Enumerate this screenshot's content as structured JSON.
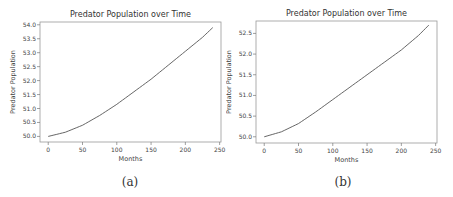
{
  "chart_data": [
    {
      "type": "line",
      "panel_label": "(a)",
      "title": "Predator Population over Time",
      "xlabel": "Months",
      "ylabel": "Predator Population",
      "xlim": [
        -12,
        252
      ],
      "ylim": [
        49.8,
        54.1
      ],
      "xticks": [
        0,
        50,
        100,
        150,
        200,
        250
      ],
      "yticks": [
        50.0,
        50.5,
        51.0,
        51.5,
        52.0,
        52.5,
        53.0,
        53.5,
        54.0
      ],
      "grid": false,
      "series": [
        {
          "name": "Predator Population",
          "color": "#555555",
          "x": [
            0,
            25,
            50,
            75,
            100,
            125,
            150,
            175,
            200,
            225,
            240
          ],
          "y": [
            50.0,
            50.15,
            50.4,
            50.75,
            51.15,
            51.6,
            52.05,
            52.55,
            53.05,
            53.55,
            53.9
          ]
        }
      ]
    },
    {
      "type": "line",
      "panel_label": "(b)",
      "title": "Predator Population over Time",
      "xlabel": "Months",
      "ylabel": "Predator Population",
      "xlim": [
        -12,
        252
      ],
      "ylim": [
        49.85,
        52.8
      ],
      "xticks": [
        0,
        50,
        100,
        150,
        200,
        250
      ],
      "yticks": [
        50.0,
        50.5,
        51.0,
        51.5,
        52.0,
        52.5
      ],
      "grid": false,
      "series": [
        {
          "name": "Predator Population",
          "color": "#555555",
          "x": [
            0,
            25,
            50,
            75,
            100,
            125,
            150,
            175,
            200,
            225,
            240
          ],
          "y": [
            50.0,
            50.12,
            50.32,
            50.6,
            50.9,
            51.2,
            51.5,
            51.8,
            52.1,
            52.45,
            52.7
          ]
        }
      ]
    }
  ]
}
